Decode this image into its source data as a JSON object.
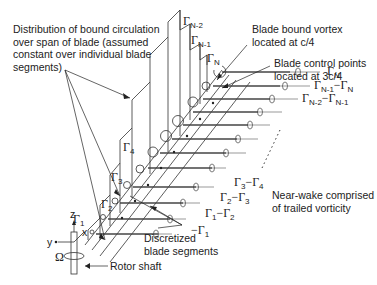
{
  "annotations": {
    "distribution": [
      "Distribution of bound circulation",
      "over span of blade (assumed",
      "constant over individual blade",
      "segments)"
    ],
    "bound_vortex": [
      "Blade bound vortex",
      "located at c/4"
    ],
    "control_points": [
      "Blade control points",
      "located at 3c/4"
    ],
    "near_wake": [
      "Near-wake comprised",
      "of trailed vorticity"
    ],
    "discretized": [
      "Discretized",
      "blade segments"
    ],
    "rotor_shaft": "Rotor shaft"
  },
  "axes": {
    "z": "z",
    "y": "y",
    "x": "x",
    "omega": "Ω"
  },
  "bound_circulation_labels": [
    {
      "sym": "Γ",
      "sub": "1"
    },
    {
      "sym": "Γ",
      "sub": "2"
    },
    {
      "sym": "Γ",
      "sub": "3"
    },
    {
      "sym": "Γ",
      "sub": "4"
    },
    {
      "sym": "Γ",
      "sub": "N-2"
    },
    {
      "sym": "Γ",
      "sub": "N-1"
    },
    {
      "sym": "Γ",
      "sub": "N"
    }
  ],
  "trailed_vortex_labels": [
    {
      "text": "Γ",
      "sub": "N",
      "rest": ""
    },
    {
      "text": "Γ",
      "sub": "N-1",
      "rest": "−Γ",
      "sub2": "N"
    },
    {
      "text": "Γ",
      "sub": "N-2",
      "rest": "−Γ",
      "sub2": "N-1"
    },
    {
      "text": "Γ",
      "sub": "3",
      "rest": "−Γ",
      "sub2": "4"
    },
    {
      "text": "Γ",
      "sub": "2",
      "rest": "−Γ",
      "sub2": "3"
    },
    {
      "text": "Γ",
      "sub": "1",
      "rest": "−Γ",
      "sub2": "2"
    },
    {
      "text": "−Γ",
      "sub": "1",
      "rest": ""
    }
  ]
}
